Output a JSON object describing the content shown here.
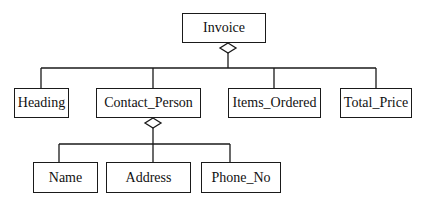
{
  "diagram": {
    "type": "aggregation-tree",
    "stroke_color": "#1a1a1a",
    "root": {
      "label": "Invoice",
      "children": [
        {
          "label": "Heading"
        },
        {
          "label": "Contact_Person",
          "children": [
            {
              "label": "Name"
            },
            {
              "label": "Address"
            },
            {
              "label": "Phone_No"
            }
          ]
        },
        {
          "label": "Items_Ordered"
        },
        {
          "label": "Total_Price"
        }
      ]
    }
  }
}
